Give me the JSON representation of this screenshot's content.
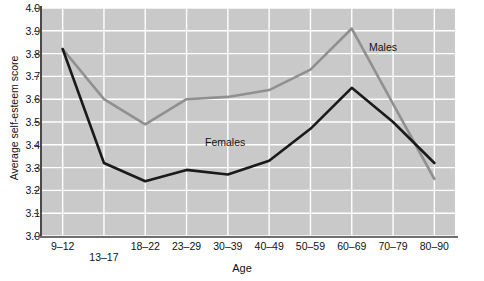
{
  "chart_data": {
    "type": "line",
    "title": "",
    "xlabel": "Age",
    "ylabel": "Average self-esteem score",
    "categories": [
      "9–12",
      "13–17",
      "18–22",
      "23–29",
      "30–39",
      "40–49",
      "50–59",
      "60–69",
      "70–79",
      "80–90"
    ],
    "ylim": [
      3.0,
      4.0
    ],
    "ytick_step": 0.1,
    "yticks": [
      "4.0",
      "3.9",
      "3.8",
      "3.7",
      "3.6",
      "3.5",
      "3.4",
      "3.3",
      "3.2",
      "3.1",
      "3.0"
    ],
    "grid": true,
    "grid_color": "#ffffff",
    "plot_background": "#c9c9c9",
    "legend_position": "inline-annotations",
    "series": [
      {
        "name": "Males",
        "color": "#909090",
        "values": [
          3.82,
          3.6,
          3.49,
          3.6,
          3.61,
          3.64,
          3.73,
          3.91,
          3.58,
          3.25
        ]
      },
      {
        "name": "Females",
        "color": "#1a1a1a",
        "values": [
          3.82,
          3.32,
          3.24,
          3.29,
          3.27,
          3.33,
          3.47,
          3.65,
          3.5,
          3.32
        ]
      }
    ],
    "annotations": [
      {
        "text": "Males",
        "series": "Males"
      },
      {
        "text": "Females",
        "series": "Females"
      }
    ]
  }
}
